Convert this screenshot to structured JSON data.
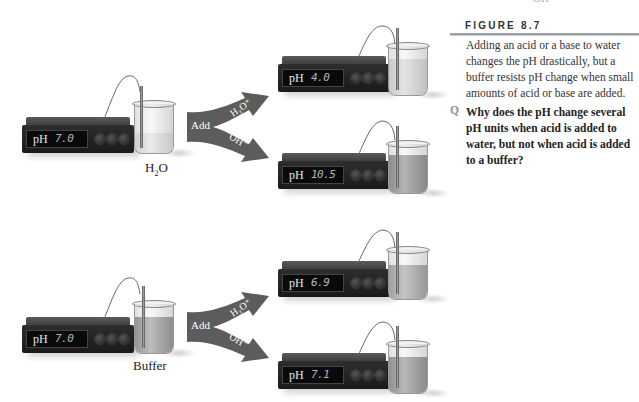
{
  "header_fragment": "OH",
  "figure": {
    "title": "FIGURE 8.7",
    "caption": "Adding an acid or a base to water changes the pH drastically, but a buffer resists pH change when small amounts of acid or base are added.",
    "question_marker": "Q",
    "question": "Why does the pH change several pH units when acid is added to water, but not when acid is added to a buffer?"
  },
  "experiments": [
    {
      "sample": {
        "label_main": "H",
        "label_sub": "2",
        "label_tail": "O"
      },
      "initial_meter": {
        "label": "pH",
        "value": "7.0"
      },
      "arrow": {
        "add_label": "Add",
        "acid_label": "H₃O⁺",
        "base_label": "OH⁻"
      },
      "results": [
        {
          "reagent": "H₃O⁺",
          "meter_label": "pH",
          "value": "4.0"
        },
        {
          "reagent": "OH⁻",
          "meter_label": "pH",
          "value": "10.5"
        }
      ]
    },
    {
      "sample": {
        "label_main": "Buffer",
        "label_sub": "",
        "label_tail": ""
      },
      "initial_meter": {
        "label": "pH",
        "value": "7.0"
      },
      "arrow": {
        "add_label": "Add",
        "acid_label": "H₃O⁺",
        "base_label": "OH⁻"
      },
      "results": [
        {
          "reagent": "H₃O⁺",
          "meter_label": "pH",
          "value": "6.9"
        },
        {
          "reagent": "OH⁻",
          "meter_label": "pH",
          "value": "7.1"
        }
      ]
    }
  ],
  "colors": {
    "arrow_fill": "#5a5a5a",
    "meter_body": "#1f1f1f",
    "display_text": "#aab4c4",
    "water_liquid": "#d8d8d8",
    "buffer_liquid": "#9a9a9a",
    "rule": "#9aa0a6"
  }
}
